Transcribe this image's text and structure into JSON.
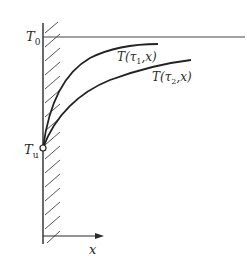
{
  "diagram": {
    "type": "temperature profile",
    "labels": {
      "T0": "T",
      "T0_sub": "0",
      "Tu": "T",
      "Tu_sub": "u",
      "x_axis": "x",
      "curve1": "T(τ",
      "curve1_sub": "1",
      "curve1_tail": ",x)",
      "curve2": "T(τ",
      "curve2_sub": "2",
      "curve2_tail": ",x)"
    },
    "curves": [
      {
        "name": "T(τ1,x)",
        "description": "steeper profile, approaches T0 faster"
      },
      {
        "name": "T(τ2,x)",
        "description": "flatter profile, later time"
      }
    ],
    "colors": {
      "ink": "#2a2a2a",
      "hatch": "#555555"
    }
  }
}
